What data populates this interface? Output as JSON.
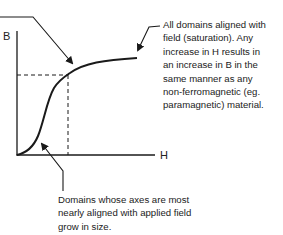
{
  "diagram": {
    "title": "",
    "type": "B-H magnetization curve",
    "axes": {
      "y_label": "B",
      "x_label": "H"
    },
    "annotations": {
      "saturation_note": "All domains aligned with\nfield (saturation). Any\nincrease in H results in\nan increase in B in the\nsame manner as any\nnon-ferromagnetic (eg.\nparamagnetic) material.",
      "growth_note": "Domains whose axes are most\nnearly aligned with applied field\ngrow in size."
    },
    "colors": {
      "line": "#1a1a1a",
      "background": "#ffffff"
    }
  }
}
